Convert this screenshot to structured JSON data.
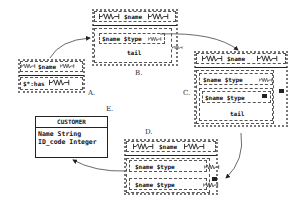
{
  "diagram": {
    "labels": {
      "a": "A.",
      "b": "B.",
      "c": "C.",
      "d": "D.",
      "e": "E."
    },
    "box_a": {
      "header": "$name",
      "body": "$*:has"
    },
    "box_b": {
      "header": "$name",
      "inner_row": "$name $type",
      "tail": "tail"
    },
    "box_c": {
      "header": "$name",
      "row1": "$name $type",
      "row2": "$name $type",
      "tail": "tail"
    },
    "box_d": {
      "header": "$name",
      "row1": "$name $type",
      "row2": "$name $type"
    },
    "entity_e": {
      "title": "CUSTOMER",
      "attributes": [
        {
          "name": "Name",
          "type": "String"
        },
        {
          "name": "ID_code",
          "type": "Integer"
        }
      ],
      "row1": "Name String",
      "row2": "ID_code Integer"
    },
    "colors": {
      "line": "#222222",
      "dotted_border": "#777777",
      "background": "#ffffff"
    }
  }
}
